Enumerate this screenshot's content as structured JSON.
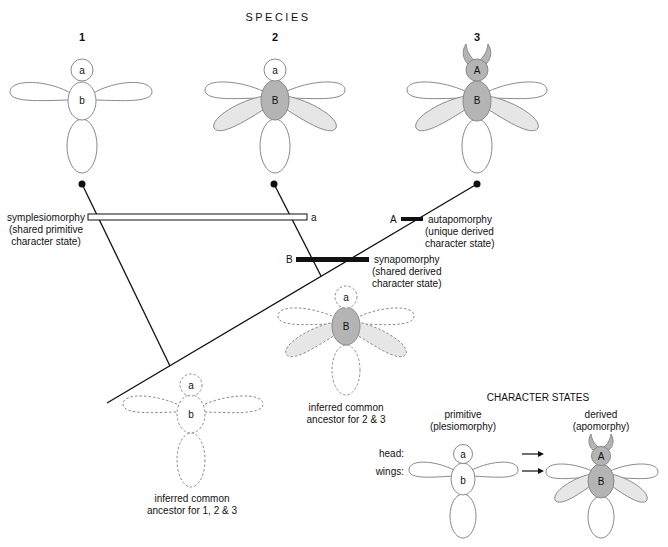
{
  "title": "SPECIES",
  "species": [
    {
      "number": "1",
      "head_label": "a",
      "body_label": "b",
      "head_state": "primitive",
      "wing_state": "primitive"
    },
    {
      "number": "2",
      "head_label": "a",
      "body_label": "B",
      "head_state": "primitive",
      "wing_state": "derived"
    },
    {
      "number": "3",
      "head_label": "A",
      "body_label": "B",
      "head_state": "derived",
      "wing_state": "derived"
    }
  ],
  "characters": {
    "symplesiomorphy": {
      "marker": "a",
      "line1": "symplesiomorphy",
      "line2": "(shared primitive",
      "line3": "character state)"
    },
    "autapomorphy": {
      "marker": "A",
      "line1": "autapomorphy",
      "line2": "(unique derived",
      "line3": "character state)"
    },
    "synapomorphy": {
      "marker": "B",
      "line1": "synapomorphy",
      "line2": "(shared derived",
      "line3": "character state)"
    }
  },
  "ancestors": [
    {
      "head_label": "a",
      "body_label": "b",
      "line1": "inferred common",
      "line2": "ancestor for 1, 2 & 3"
    },
    {
      "head_label": "a",
      "body_label": "B",
      "line1": "inferred common",
      "line2": "ancestor for 2 & 3"
    }
  ],
  "legend": {
    "title": "CHARACTER STATES",
    "primitive_line1": "primitive",
    "primitive_line2": "(plesiomorphy)",
    "derived_line1": "derived",
    "derived_line2": "(apomorphy)",
    "row_head": "head:",
    "row_wings": "wings:",
    "primitive_head": "a",
    "primitive_body": "b",
    "derived_head": "A",
    "derived_body": "B"
  },
  "colors": {
    "outline": "#8a8a8a",
    "derived_body": "#b4b4b4",
    "derived_wing": "#e6e6e6",
    "line": "#111111"
  }
}
